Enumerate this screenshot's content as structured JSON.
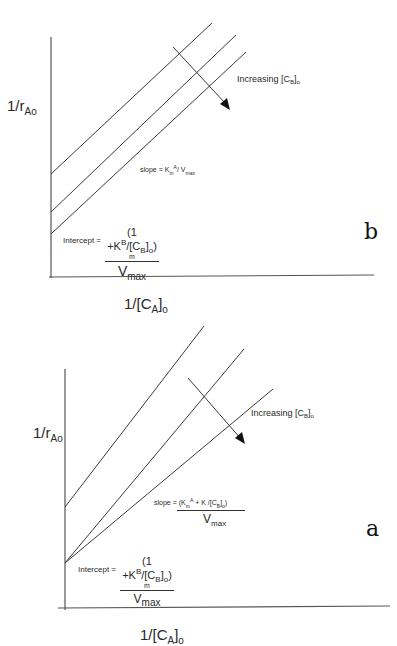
{
  "figure": {
    "panels": [
      {
        "id": "b",
        "panel_label": "b",
        "y_axis_label_main": "1/r",
        "y_axis_label_sub": "Ao",
        "x_axis_label_main": "1/[C",
        "x_axis_label_sub": "A",
        "x_axis_label_tail": "]",
        "x_axis_label_tail_sub": "o",
        "arrow_label_main": "Increasing [C",
        "arrow_label_sub": "B",
        "arrow_label_tail": "]",
        "arrow_label_tail_sub": "o",
        "slope_label": "slope = K",
        "slope_sub": "m",
        "slope_sup": "A",
        "slope_tail": "/ V",
        "slope_tail_sub": "max",
        "intercept_label": "Intercept =",
        "intercept_num": "(1 +K",
        "intercept_num_sup": "B",
        "intercept_num_mid": "/[C",
        "intercept_num_sub": "B",
        "intercept_num_tail": "]",
        "intercept_num_tail_sub": "o",
        "intercept_num_close": ")",
        "intercept_m": "m",
        "intercept_den": "V",
        "intercept_den_sub": "max",
        "description": "Three parallel lines with equal slope; intercept decreases with increasing [C_B]o"
      },
      {
        "id": "a",
        "panel_label": "a",
        "y_axis_label_main": "1/r",
        "y_axis_label_sub": "Ao",
        "x_axis_label_main": "1/[C",
        "x_axis_label_sub": "A",
        "x_axis_label_tail": "]",
        "x_axis_label_tail_sub": "o",
        "arrow_label_main": "Increasing [C",
        "arrow_label_sub": "B",
        "arrow_label_tail": "]",
        "arrow_label_tail_sub": "o",
        "slope_label": "slope = (K",
        "slope_sub": "m",
        "slope_sup": "A",
        "slope_mid": " + K /[C",
        "slope_mid_sub": "B",
        "slope_tail": "]",
        "slope_tail_sub": "o",
        "slope_close": ")",
        "slope_den": "V",
        "slope_den_sub": "max",
        "intercept_label": "Intercept =",
        "intercept_num": "(1 +K",
        "intercept_num_sup": "B",
        "intercept_num_mid": "/[C",
        "intercept_num_sub": "B",
        "intercept_num_tail": "]",
        "intercept_num_tail_sub": "o",
        "intercept_num_close": ")",
        "intercept_m": "m",
        "intercept_den": "V",
        "intercept_den_sub": "max",
        "description": "Three lines with differing slopes and intercepts; both decrease with increasing [C_B]o"
      }
    ],
    "colors": {
      "line": "#3a3a3a",
      "axis": "#444444",
      "text": "#2a2a2a",
      "background": "#ffffff"
    }
  }
}
